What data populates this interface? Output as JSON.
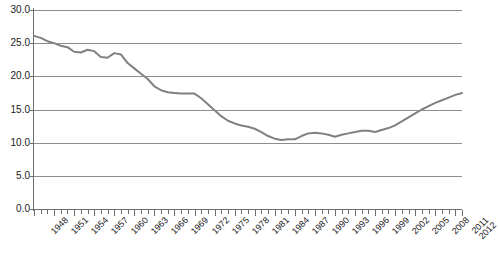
{
  "chart_data": {
    "type": "line",
    "title": "",
    "subtitle": "",
    "xlabel": "",
    "ylabel": "",
    "xlim": [
      1948,
      2012
    ],
    "ylim": [
      0.0,
      30.0
    ],
    "grid": "horizontal",
    "legend": "none",
    "line_color": "#808080",
    "gridline_color": "#8c8c8c",
    "axis_color": "#6e6e6e",
    "y_ticks": [
      "0.0",
      "5.0",
      "10.0",
      "15.0",
      "20.0",
      "25.0",
      "30.0"
    ],
    "y_tick_values": [
      0.0,
      5.0,
      10.0,
      15.0,
      20.0,
      25.0,
      30.0
    ],
    "x_tick_labels": [
      "1948",
      "1951",
      "1954",
      "1957",
      "1960",
      "1963",
      "1966",
      "1969",
      "1972",
      "1975",
      "1978",
      "1981",
      "1984",
      "1987",
      "1990",
      "1993",
      "1996",
      "1999",
      "2002",
      "2005",
      "2008",
      "2011",
      "2012"
    ],
    "x_tick_label_years": [
      1948,
      1951,
      1954,
      1957,
      1960,
      1963,
      1966,
      1969,
      1972,
      1975,
      1978,
      1981,
      1984,
      1987,
      1990,
      1993,
      1996,
      1999,
      2002,
      2005,
      2008,
      2011,
      2012
    ],
    "x": [
      1948,
      1949,
      1950,
      1951,
      1952,
      1953,
      1954,
      1955,
      1956,
      1957,
      1958,
      1959,
      1960,
      1961,
      1962,
      1963,
      1964,
      1965,
      1966,
      1967,
      1968,
      1969,
      1970,
      1971,
      1972,
      1973,
      1974,
      1975,
      1976,
      1977,
      1978,
      1979,
      1980,
      1981,
      1982,
      1983,
      1984,
      1985,
      1986,
      1987,
      1988,
      1989,
      1990,
      1991,
      1992,
      1993,
      1994,
      1995,
      1996,
      1997,
      1998,
      1999,
      2000,
      2001,
      2002,
      2003,
      2004,
      2005,
      2006,
      2007,
      2008,
      2009,
      2010,
      2011,
      2012
    ],
    "values": [
      26.1,
      25.8,
      25.3,
      25.0,
      24.6,
      24.4,
      23.7,
      23.6,
      24.0,
      23.8,
      22.9,
      22.8,
      23.5,
      23.3,
      22.0,
      21.2,
      20.4,
      19.6,
      18.5,
      17.9,
      17.6,
      17.5,
      17.4,
      17.4,
      17.4,
      16.7,
      15.8,
      14.9,
      14.0,
      13.3,
      12.9,
      12.6,
      12.4,
      12.1,
      11.6,
      11.0,
      10.6,
      10.4,
      10.5,
      10.5,
      11.0,
      11.4,
      11.5,
      11.4,
      11.2,
      10.9,
      11.2,
      11.4,
      11.6,
      11.8,
      11.8,
      11.6,
      11.9,
      12.2,
      12.6,
      13.2,
      13.8,
      14.4,
      15.0,
      15.5,
      16.0,
      16.4,
      16.8,
      17.2,
      17.5
    ]
  }
}
